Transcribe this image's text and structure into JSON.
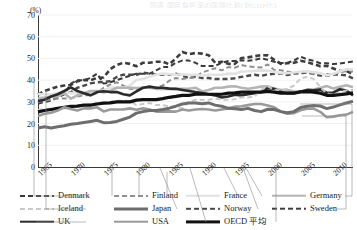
{
  "title_strip": "図表 国民負担率の国際比較(対GDP比)",
  "axis": {
    "unit_label": "(%)",
    "y_ticks": [
      0,
      10,
      20,
      30,
      40,
      50,
      60,
      70
    ],
    "x_ticks": [
      "1965",
      "1970",
      "1975",
      "1980",
      "1985",
      "1990",
      "1995",
      "2000",
      "2005",
      "2010"
    ]
  },
  "legend": {
    "columns": [
      [
        {
          "label": "Denmark",
          "style": "dashed",
          "color": "#3a3a3a",
          "width": 2.0
        },
        {
          "label": "Iceland",
          "style": "dashed",
          "color": "#c9c9c9",
          "width": 2.0
        },
        {
          "label": "UK",
          "style": "solid",
          "color": "#2b2b2b",
          "width": 2.6
        }
      ],
      [
        {
          "label": "Finland",
          "style": "dashed",
          "color": "#8f8f8f",
          "width": 2.0
        },
        {
          "label": "Japan",
          "style": "solid",
          "color": "#6e6e6e",
          "width": 3.0
        },
        {
          "label": "USA",
          "style": "solid",
          "color": "#9a9a9a",
          "width": 2.6
        }
      ],
      [
        {
          "label": "France",
          "style": "solid",
          "color": "#e2e2e2",
          "width": 2.6
        },
        {
          "label": "Norway",
          "style": "dashed",
          "color": "#4a4a4a",
          "width": 2.4
        },
        {
          "label": "OECD 平均",
          "style": "solid",
          "color": "#111111",
          "width": 3.2
        }
      ],
      [
        {
          "label": "Germany",
          "style": "solid",
          "color": "#b4b4b4",
          "width": 2.6
        },
        {
          "label": "Sweden",
          "style": "dashed",
          "color": "#3d3d3d",
          "width": 2.6
        }
      ]
    ]
  },
  "chart_data": {
    "type": "line",
    "title": "",
    "xlabel": "",
    "ylabel": "(%)",
    "ylim": [
      0,
      70
    ],
    "xlim": [
      1965,
      2013
    ],
    "grid": true,
    "legend_position": "bottom",
    "x": [
      1965,
      1966,
      1967,
      1968,
      1969,
      1970,
      1971,
      1972,
      1973,
      1974,
      1975,
      1976,
      1977,
      1978,
      1979,
      1980,
      1981,
      1982,
      1983,
      1984,
      1985,
      1986,
      1987,
      1988,
      1989,
      1990,
      1991,
      1992,
      1993,
      1994,
      1995,
      1996,
      1997,
      1998,
      1999,
      2000,
      2001,
      2002,
      2003,
      2004,
      2005,
      2006,
      2007,
      2008,
      2009,
      2010,
      2011,
      2012,
      2013
    ],
    "series": [
      {
        "name": "Sweden",
        "style": "dashed",
        "color": "#3d3d3d",
        "values": [
          33.3,
          35.0,
          36.0,
          37.0,
          37.5,
          37.8,
          39.5,
          40.0,
          40.0,
          41.0,
          41.2,
          45.0,
          47.0,
          48.0,
          47.5,
          46.4,
          48.0,
          48.0,
          48.5,
          48.5,
          47.3,
          50.0,
          53.0,
          52.0,
          52.5,
          52.2,
          51.5,
          48.0,
          48.5,
          47.5,
          47.5,
          50.2,
          50.5,
          51.0,
          51.5,
          51.4,
          49.4,
          47.5,
          47.8,
          48.0,
          48.9,
          48.3,
          47.4,
          46.4,
          46.6,
          45.4,
          44.2,
          44.2,
          42.8
        ]
      },
      {
        "name": "Denmark",
        "style": "dashed",
        "color": "#3a3a3a",
        "values": [
          29.1,
          30.0,
          30.5,
          32.0,
          33.5,
          38.4,
          40.0,
          40.0,
          41.0,
          43.0,
          38.4,
          39.0,
          40.0,
          41.0,
          42.0,
          43.0,
          43.0,
          43.0,
          44.5,
          46.0,
          46.1,
          48.0,
          49.0,
          49.0,
          48.0,
          46.5,
          46.5,
          46.5,
          48.0,
          48.8,
          48.8,
          49.2,
          48.9,
          49.3,
          50.1,
          49.4,
          48.5,
          47.9,
          48.0,
          49.0,
          50.8,
          49.6,
          48.9,
          47.8,
          47.8,
          47.4,
          47.7,
          48.1,
          48.6
        ]
      },
      {
        "name": "Norway",
        "style": "dashed",
        "color": "#4a4a4a",
        "values": [
          29.6,
          31.0,
          32.0,
          33.5,
          34.0,
          34.4,
          36.5,
          37.5,
          38.5,
          39.0,
          39.2,
          39.5,
          41.5,
          42.5,
          42.5,
          42.4,
          43.5,
          43.0,
          42.5,
          42.5,
          42.6,
          43.0,
          42.0,
          41.0,
          41.5,
          41.0,
          41.0,
          40.5,
          40.5,
          40.5,
          40.9,
          41.5,
          42.0,
          42.5,
          42.0,
          42.6,
          42.9,
          43.1,
          42.3,
          43.0,
          43.2,
          43.5,
          42.9,
          42.1,
          42.0,
          42.6,
          42.5,
          42.2,
          40.8
        ]
      },
      {
        "name": "Finland",
        "style": "dashed",
        "color": "#8f8f8f",
        "values": [
          30.0,
          30.5,
          31.0,
          31.5,
          31.5,
          31.5,
          32.5,
          33.0,
          33.0,
          34.0,
          36.5,
          38.0,
          39.0,
          37.5,
          36.0,
          35.7,
          36.5,
          36.5,
          36.5,
          37.5,
          39.7,
          41.0,
          40.5,
          41.0,
          41.5,
          43.5,
          44.5,
          45.5,
          44.5,
          46.0,
          45.7,
          47.0,
          46.3,
          46.1,
          45.8,
          47.2,
          44.7,
          44.6,
          44.0,
          43.5,
          43.9,
          43.8,
          42.9,
          42.9,
          42.8,
          42.5,
          43.7,
          44.1,
          44.0
        ]
      },
      {
        "name": "France",
        "style": "solid",
        "color": "#e2e2e2",
        "values": [
          33.6,
          33.5,
          33.5,
          34.0,
          34.5,
          34.1,
          34.0,
          34.0,
          34.0,
          34.5,
          35.4,
          36.5,
          36.5,
          36.5,
          37.5,
          40.1,
          40.5,
          41.5,
          42.5,
          43.0,
          42.8,
          42.5,
          42.7,
          42.5,
          42.5,
          42.0,
          42.5,
          42.5,
          42.5,
          43.0,
          42.9,
          44.0,
          44.1,
          44.3,
          44.5,
          44.4,
          43.8,
          43.3,
          43.2,
          43.5,
          43.9,
          44.1,
          43.7,
          43.2,
          42.1,
          42.9,
          44.1,
          45.0,
          45.0
        ]
      },
      {
        "name": "Germany",
        "style": "solid",
        "color": "#b4b4b4",
        "values": [
          31.6,
          32.0,
          32.5,
          32.5,
          34.0,
          31.5,
          33.0,
          34.0,
          35.0,
          35.0,
          34.3,
          35.0,
          36.5,
          36.5,
          36.5,
          36.4,
          36.5,
          36.5,
          36.0,
          36.0,
          36.1,
          36.0,
          36.0,
          36.0,
          36.5,
          34.8,
          35.5,
          36.5,
          36.5,
          37.0,
          37.2,
          36.5,
          36.0,
          36.5,
          37.0,
          37.2,
          36.1,
          35.4,
          35.5,
          34.8,
          34.8,
          35.4,
          35.7,
          36.4,
          37.3,
          36.1,
          36.9,
          37.6,
          36.7
        ]
      },
      {
        "name": "UK",
        "style": "solid",
        "color": "#2b2b2b",
        "values": [
          30.4,
          31.0,
          32.5,
          33.5,
          35.0,
          36.7,
          35.0,
          34.0,
          33.0,
          34.5,
          34.9,
          34.5,
          34.5,
          33.5,
          33.0,
          34.8,
          36.5,
          37.0,
          36.5,
          36.5,
          36.1,
          36.0,
          35.5,
          35.0,
          34.5,
          34.1,
          33.5,
          33.0,
          32.0,
          32.5,
          33.3,
          33.0,
          33.5,
          34.0,
          34.5,
          36.3,
          36.0,
          34.5,
          34.0,
          34.0,
          34.7,
          35.5,
          35.3,
          35.7,
          34.2,
          34.3,
          35.8,
          35.2,
          32.9
        ]
      },
      {
        "name": "Iceland",
        "style": "dashed",
        "color": "#c9c9c9",
        "values": [
          26.2,
          26.5,
          27.0,
          27.0,
          27.0,
          27.0,
          28.5,
          28.5,
          29.0,
          29.5,
          29.7,
          30.0,
          30.5,
          30.5,
          30.5,
          28.5,
          29.0,
          29.5,
          28.5,
          28.5,
          28.0,
          27.5,
          27.0,
          30.0,
          31.0,
          30.9,
          31.0,
          31.5,
          31.0,
          31.0,
          31.2,
          32.0,
          32.0,
          32.5,
          35.5,
          37.2,
          35.5,
          35.3,
          36.0,
          37.5,
          40.7,
          41.5,
          40.6,
          36.8,
          33.9,
          33.3,
          34.5,
          35.3,
          35.5
        ]
      },
      {
        "name": "OECD 平均",
        "style": "solid",
        "color": "#111111",
        "values": [
          25.4,
          26.0,
          26.5,
          27.0,
          27.5,
          27.9,
          28.0,
          28.5,
          28.5,
          29.0,
          29.4,
          29.5,
          30.0,
          30.0,
          30.0,
          30.8,
          31.0,
          31.0,
          31.0,
          31.5,
          32.1,
          32.5,
          33.0,
          33.0,
          33.5,
          33.6,
          33.5,
          33.5,
          33.5,
          34.0,
          34.1,
          34.5,
          34.5,
          34.5,
          34.5,
          34.8,
          34.5,
          34.0,
          34.0,
          34.0,
          34.6,
          34.7,
          34.5,
          34.0,
          33.0,
          33.0,
          33.3,
          33.7,
          34.1
        ]
      },
      {
        "name": "USA",
        "style": "solid",
        "color": "#9a9a9a",
        "values": [
          23.5,
          24.5,
          25.0,
          26.0,
          27.5,
          26.7,
          26.0,
          27.0,
          27.0,
          27.5,
          25.6,
          26.5,
          26.5,
          26.5,
          27.0,
          26.4,
          27.0,
          26.5,
          25.5,
          25.5,
          25.6,
          25.5,
          26.5,
          26.0,
          26.5,
          26.7,
          26.5,
          26.0,
          26.5,
          27.0,
          27.8,
          28.0,
          28.5,
          29.0,
          29.0,
          28.3,
          27.5,
          25.5,
          24.5,
          24.8,
          26.1,
          26.8,
          26.9,
          25.4,
          22.9,
          23.2,
          23.8,
          24.1,
          25.4
        ]
      },
      {
        "name": "Japan",
        "style": "solid",
        "color": "#6e6e6e",
        "values": [
          18.0,
          18.5,
          18.0,
          18.5,
          19.0,
          19.7,
          20.0,
          20.5,
          21.0,
          21.5,
          20.4,
          20.5,
          21.0,
          22.0,
          23.0,
          24.8,
          25.5,
          26.0,
          26.0,
          26.5,
          27.1,
          28.0,
          29.0,
          29.5,
          29.5,
          29.1,
          29.5,
          28.5,
          28.0,
          27.0,
          26.8,
          26.5,
          27.0,
          26.0,
          25.5,
          26.6,
          26.5,
          25.5,
          25.0,
          25.5,
          27.4,
          28.0,
          28.3,
          28.1,
          26.9,
          27.6,
          28.6,
          29.5,
          30.3
        ]
      }
    ]
  }
}
